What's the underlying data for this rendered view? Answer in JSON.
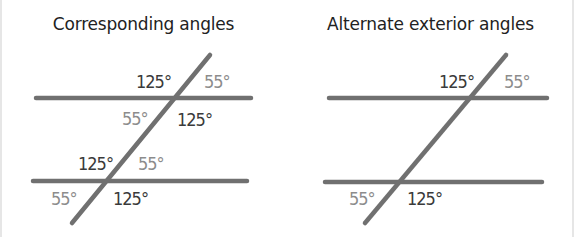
{
  "panels": [
    {
      "title": "Corresponding angles",
      "labels": [
        {
          "text": "125°",
          "x": 136,
          "y": 88,
          "tone": "dark"
        },
        {
          "text": "55°",
          "x": 204,
          "y": 88,
          "tone": "light"
        },
        {
          "text": "55°",
          "x": 122,
          "y": 125,
          "tone": "light"
        },
        {
          "text": "125°",
          "x": 177,
          "y": 126,
          "tone": "dark"
        },
        {
          "text": "125°",
          "x": 78,
          "y": 170,
          "tone": "dark"
        },
        {
          "text": "55°",
          "x": 138,
          "y": 170,
          "tone": "light"
        },
        {
          "text": "55°",
          "x": 51,
          "y": 205,
          "tone": "light"
        },
        {
          "text": "125°",
          "x": 113,
          "y": 205,
          "tone": "dark"
        }
      ]
    },
    {
      "title": "Alternate exterior angles",
      "labels": [
        {
          "text": "125°",
          "x": 152,
          "y": 88,
          "tone": "dark"
        },
        {
          "text": "55°",
          "x": 217,
          "y": 88,
          "tone": "light"
        },
        {
          "text": "55°",
          "x": 62,
          "y": 205,
          "tone": "light"
        },
        {
          "text": "125°",
          "x": 120,
          "y": 205,
          "tone": "dark"
        }
      ]
    }
  ],
  "colors": {
    "line": "#707070",
    "dark_label": "#3a3a3a",
    "light_label": "#8c8c8c"
  }
}
